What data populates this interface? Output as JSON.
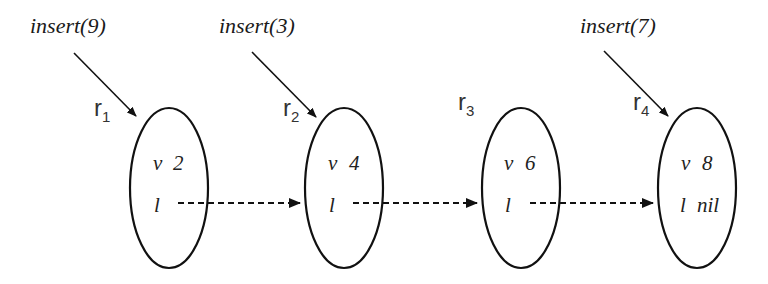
{
  "diagram": {
    "operations": [
      {
        "label": "insert(9)",
        "target": "r1"
      },
      {
        "label": "insert(3)",
        "target": "r2"
      },
      {
        "label": "insert(7)",
        "target": "r4"
      }
    ],
    "nodes": [
      {
        "id": "r1",
        "name": "r",
        "sub": "1",
        "v_label": "v",
        "v_value": "2",
        "l_label": "l",
        "l_value": ""
      },
      {
        "id": "r2",
        "name": "r",
        "sub": "2",
        "v_label": "v",
        "v_value": "4",
        "l_label": "l",
        "l_value": ""
      },
      {
        "id": "r3",
        "name": "r",
        "sub": "3",
        "v_label": "v",
        "v_value": "6",
        "l_label": "l",
        "l_value": ""
      },
      {
        "id": "r4",
        "name": "r",
        "sub": "4",
        "v_label": "v",
        "v_value": "8",
        "l_label": "l",
        "l_value": "nil"
      }
    ],
    "links": [
      {
        "from": "r1",
        "to": "r2",
        "style": "dashed"
      },
      {
        "from": "r2",
        "to": "r3",
        "style": "dashed"
      },
      {
        "from": "r3",
        "to": "r4",
        "style": "dashed"
      }
    ],
    "colors": {
      "stroke": "#111111",
      "text": "#222222",
      "background": "#ffffff"
    }
  }
}
